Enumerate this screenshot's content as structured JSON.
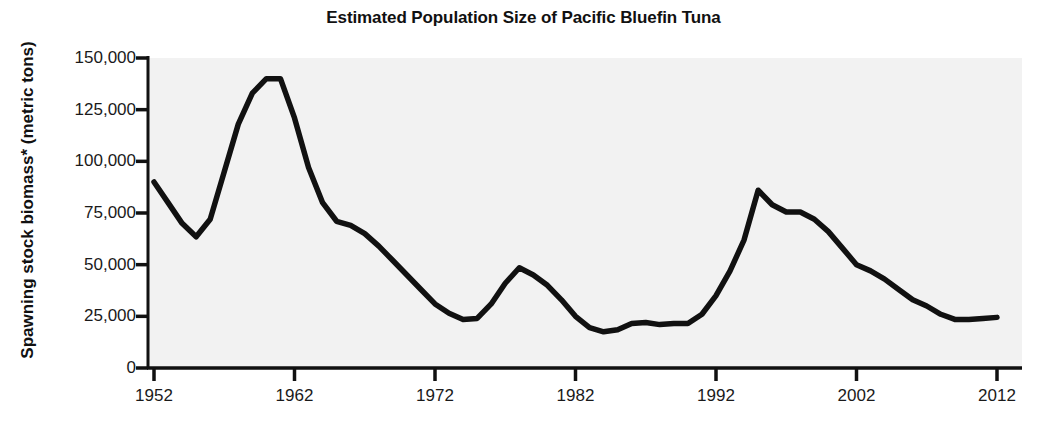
{
  "chart": {
    "title": "Estimated Population Size of Pacific Bluefin Tuna",
    "ylabel": "Spawning stock biomass* (metric tons)",
    "xlabel": ""
  },
  "chart_data": {
    "type": "line",
    "title": "Estimated Population Size of Pacific Bluefin Tuna",
    "xlabel": "",
    "ylabel": "Spawning stock biomass* (metric tons)",
    "xlim": [
      1952,
      2012
    ],
    "ylim": [
      0,
      150000
    ],
    "grid": false,
    "legend": null,
    "line_color": "#111111",
    "plot_background": "#f2f2f2",
    "xticks": [
      1952,
      1962,
      1972,
      1982,
      1992,
      2002,
      2012
    ],
    "xtick_labels": [
      "1952",
      "1962",
      "1972",
      "1982",
      "1992",
      "2002",
      "2012"
    ],
    "yticks": [
      0,
      25000,
      50000,
      75000,
      100000,
      125000,
      150000
    ],
    "ytick_labels": [
      "0",
      "25,000",
      "50,000",
      "75,000",
      "100,000",
      "125,000",
      "150,000"
    ],
    "x": [
      1952,
      1953,
      1954,
      1955,
      1956,
      1957,
      1958,
      1959,
      1960,
      1961,
      1962,
      1963,
      1964,
      1965,
      1966,
      1967,
      1968,
      1969,
      1970,
      1971,
      1972,
      1973,
      1974,
      1975,
      1976,
      1977,
      1978,
      1979,
      1980,
      1981,
      1982,
      1983,
      1984,
      1985,
      1986,
      1987,
      1988,
      1989,
      1990,
      1991,
      1992,
      1993,
      1994,
      1995,
      1996,
      1997,
      1998,
      1999,
      2000,
      2001,
      2002,
      2003,
      2004,
      2005,
      2006,
      2007,
      2008,
      2009,
      2010,
      2011,
      2012
    ],
    "y": [
      90000,
      80000,
      70000,
      63500,
      72000,
      95000,
      118000,
      133000,
      140000,
      140000,
      121000,
      97000,
      80000,
      71000,
      69000,
      65000,
      59000,
      52000,
      45000,
      38000,
      31000,
      26500,
      23500,
      24000,
      31000,
      41000,
      48500,
      45000,
      40000,
      33000,
      25000,
      19500,
      17500,
      18500,
      21500,
      22000,
      21000,
      21500,
      21500,
      26000,
      35000,
      47000,
      62000,
      86000,
      79000,
      75500,
      75500,
      72000,
      66000,
      58000,
      50000,
      47000,
      43000,
      38000,
      33000,
      30000,
      26000,
      23500,
      23500,
      24000,
      24500
    ],
    "series": [
      {
        "name": "Spawning stock biomass",
        "values": [
          90000,
          80000,
          70000,
          63500,
          72000,
          95000,
          118000,
          133000,
          140000,
          140000,
          121000,
          97000,
          80000,
          71000,
          69000,
          65000,
          59000,
          52000,
          45000,
          38000,
          31000,
          26500,
          23500,
          24000,
          31000,
          41000,
          48500,
          45000,
          40000,
          33000,
          25000,
          19500,
          17500,
          18500,
          21500,
          22000,
          21000,
          21500,
          21500,
          26000,
          35000,
          47000,
          62000,
          86000,
          79000,
          75500,
          75500,
          72000,
          66000,
          58000,
          50000,
          47000,
          43000,
          38000,
          33000,
          30000,
          26000,
          23500,
          23500,
          24000,
          24500
        ]
      }
    ],
    "annotations": [
      {
        "label": "peak",
        "x": 1960,
        "y": 140000
      },
      {
        "label": "historic-low",
        "x": 1984,
        "y": 17500
      },
      {
        "label": "secondary-peak",
        "x": 1995,
        "y": 86000
      },
      {
        "label": "end-value",
        "x": 2012,
        "y": 24500
      }
    ]
  }
}
